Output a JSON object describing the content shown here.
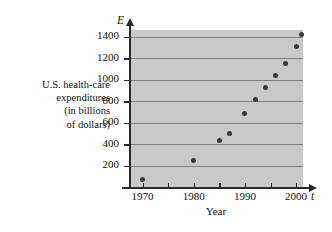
{
  "chart_data": {
    "type": "scatter",
    "title": "",
    "xlabel": "Year",
    "ylabel": "U.S. health-care expenditures (in billions of dollars)",
    "x_axis_symbol": "t",
    "y_axis_symbol": "E",
    "xlim": [
      1965,
      2003
    ],
    "ylim": [
      0,
      1500
    ],
    "x_ticks": [
      1970,
      1980,
      1990,
      2000
    ],
    "x_minor_ticks": [
      1975,
      1985,
      1995
    ],
    "y_ticks": [
      200,
      400,
      600,
      800,
      1000,
      1200,
      1400
    ],
    "grid": "horizontal",
    "legend": "none",
    "plot_background": "#c9c9c9",
    "marker_color": "#3a3a3a",
    "x": [
      1970,
      1980,
      1985,
      1987,
      1990,
      1992,
      1994,
      1996,
      1998,
      2000,
      2001
    ],
    "y": [
      75,
      250,
      435,
      500,
      690,
      820,
      930,
      1040,
      1150,
      1310,
      1420
    ],
    "points": [
      {
        "t": 1970,
        "E": 75
      },
      {
        "t": 1980,
        "E": 250
      },
      {
        "t": 1985,
        "E": 435
      },
      {
        "t": 1987,
        "E": 500
      },
      {
        "t": 1990,
        "E": 690
      },
      {
        "t": 1992,
        "E": 820
      },
      {
        "t": 1994,
        "E": 930
      },
      {
        "t": 1996,
        "E": 1040
      },
      {
        "t": 1998,
        "E": 1150
      },
      {
        "t": 2000,
        "E": 1310
      },
      {
        "t": 2001,
        "E": 1420
      }
    ]
  },
  "labels": {
    "ylabel_lines": [
      "U.S. health-care",
      "expenditures",
      "(in billions",
      "of dollars)"
    ],
    "xcaption": "Year",
    "axis_E": "E",
    "axis_t": "t",
    "ytick_labels": [
      "1400",
      "1200",
      "1000",
      "800",
      "600",
      "400",
      "200"
    ],
    "xtick_labels": [
      "1970",
      "1980",
      "1990",
      "2000"
    ]
  }
}
